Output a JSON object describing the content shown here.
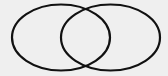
{
  "diagram": {
    "type": "venn",
    "background": "#efefef",
    "stroke_color": "#111111",
    "stroke_width": 2.2,
    "sets": [
      {
        "name": "left-set",
        "cx": 61,
        "cy": 37.5,
        "rx": 49,
        "ry": 33
      },
      {
        "name": "right-set",
        "cx": 110.5,
        "cy": 37.5,
        "rx": 49.5,
        "ry": 33
      }
    ],
    "labels": []
  }
}
